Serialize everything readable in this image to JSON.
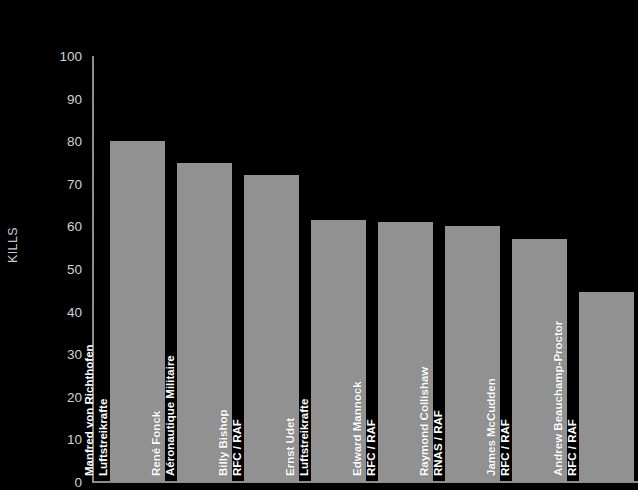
{
  "chart_data": {
    "type": "bar",
    "title": "",
    "subtitle": "",
    "xlabel": "",
    "ylabel": "KILLS",
    "ylim": [
      0,
      100
    ],
    "grid": false,
    "legend": "none",
    "yticks": [
      100,
      90,
      80,
      70,
      60,
      50,
      40,
      30,
      20,
      10,
      0
    ],
    "ytick_labels": [
      "100",
      "90",
      "80",
      "70",
      "60",
      "50",
      "40",
      "30",
      "20",
      "10",
      "0"
    ],
    "categories": [
      "Manfred von Richthofen",
      "René Fonck",
      "Billy Bishop",
      "Ernst Udet",
      "Edward Mannock",
      "Raymond Collishaw",
      "James McCudden",
      "Andrew Beauchamp-Proctor"
    ],
    "category_sublabels": [
      "Luftstreikrafte",
      "Aéronautique Militaire",
      "RFC / RAF",
      "Luftstreikrafte",
      "RFC / RAF",
      "RNAS / RAF",
      "RFC / RAF",
      "RFC / RAF"
    ],
    "values": [
      80,
      75,
      72,
      61.5,
      61,
      60,
      57,
      44.5
    ],
    "bars": [
      {
        "name": "Manfred von Richthofen",
        "unit": "Luftstreikrafte",
        "value": 80
      },
      {
        "name": "René Fonck",
        "unit": "Aéronautique Militaire",
        "value": 75
      },
      {
        "name": "Billy Bishop",
        "unit": "RFC / RAF",
        "value": 72
      },
      {
        "name": "Ernst Udet",
        "unit": "Luftstreikrafte",
        "value": 61.5
      },
      {
        "name": "Edward Mannock",
        "unit": "RFC / RAF",
        "value": 61
      },
      {
        "name": "Raymond Collishaw",
        "unit": "RNAS / RAF",
        "value": 60
      },
      {
        "name": "James McCudden",
        "unit": "RFC / RAF",
        "value": 57
      },
      {
        "name": "Andrew Beauchamp-Proctor",
        "unit": "RFC / RAF",
        "value": 44.5
      }
    ]
  },
  "colors": {
    "background": "#000000",
    "bar": "#919191",
    "axis": "#8d8d8d",
    "tick_text": "#d2d2d2",
    "bar_label_text": "#ffffff"
  }
}
